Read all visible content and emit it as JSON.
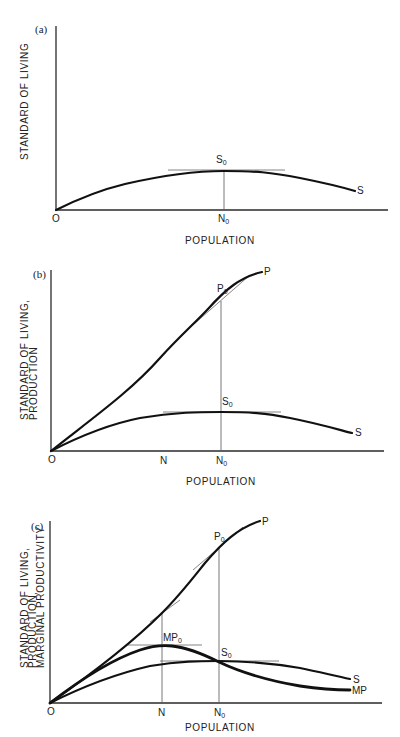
{
  "panels": [
    {
      "id": "a",
      "panel_label": "(a)",
      "y_axis_label": [
        "STANDARD  OF  LIVING"
      ],
      "x_axis_label": "POPULATION",
      "origin_label": "O",
      "x_ticks": [
        {
          "base": "N",
          "sub": "0"
        }
      ],
      "points": [
        {
          "base": "S",
          "sub": "0"
        }
      ],
      "curves": [
        "S"
      ]
    },
    {
      "id": "b",
      "panel_label": "(b)",
      "y_axis_label": [
        "STANDARD  OF  LIVING,",
        "PRODUCTION"
      ],
      "x_axis_label": "POPULATION",
      "origin_label": "O",
      "x_ticks": [
        {
          "base": "N",
          "sub": ""
        },
        {
          "base": "N",
          "sub": "0"
        }
      ],
      "points": [
        {
          "base": "P",
          "sub": "0"
        },
        {
          "base": "S",
          "sub": "0"
        }
      ],
      "curves": [
        "P",
        "S"
      ]
    },
    {
      "id": "c",
      "panel_label": "(c)",
      "y_axis_label": [
        "STANDARD  OF  LIVING,",
        "PRODUCTION,",
        "MARGINAL  PRODUCTIVITY"
      ],
      "x_axis_label": "POPULATION",
      "origin_label": "O",
      "x_ticks": [
        {
          "base": "N",
          "sub": ""
        },
        {
          "base": "N",
          "sub": "0"
        }
      ],
      "points": [
        {
          "base": "P",
          "sub": "0"
        },
        {
          "base": "MP",
          "sub": "0"
        },
        {
          "base": "S",
          "sub": "0"
        }
      ],
      "curves": [
        "P",
        "S",
        "MP"
      ]
    }
  ]
}
